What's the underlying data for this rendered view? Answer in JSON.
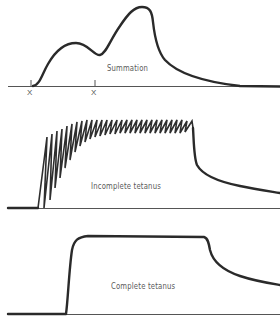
{
  "figure": {
    "panels": [
      {
        "id": "summation",
        "label": "Summation",
        "stimulus_marks": [
          "X",
          "X"
        ]
      },
      {
        "id": "incomplete-tetanus",
        "label": "Incomplete tetanus"
      },
      {
        "id": "complete-tetanus",
        "label": "Complete tetanus"
      }
    ],
    "colors": {
      "trace": "#2a2a2a",
      "baseline": "#555555",
      "label": "#5a5a5a",
      "background": "#ffffff"
    }
  }
}
